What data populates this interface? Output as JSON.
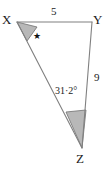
{
  "figure": {
    "type": "triangle-diagram",
    "background_color": "#ffffff",
    "line_color": "#808080",
    "shade_color": "#b8b8b8",
    "vertices": {
      "X": {
        "label": "X",
        "x": 17,
        "y": 22
      },
      "Y": {
        "label": "Y",
        "x": 92,
        "y": 22
      },
      "Z": {
        "label": "Z",
        "x": 82,
        "y": 148
      }
    },
    "sides": [
      {
        "name": "XY",
        "label": "5",
        "from": "X",
        "to": "Y"
      },
      {
        "name": "YZ",
        "label": "9",
        "from": "Y",
        "to": "Z"
      },
      {
        "name": "XZ",
        "label": "",
        "from": "X",
        "to": "Z"
      }
    ],
    "angles": [
      {
        "at": "X",
        "label": "★",
        "shaded": true,
        "unknown": true
      },
      {
        "at": "Z",
        "label": "31·2°",
        "shaded": true,
        "unknown": false
      }
    ]
  }
}
